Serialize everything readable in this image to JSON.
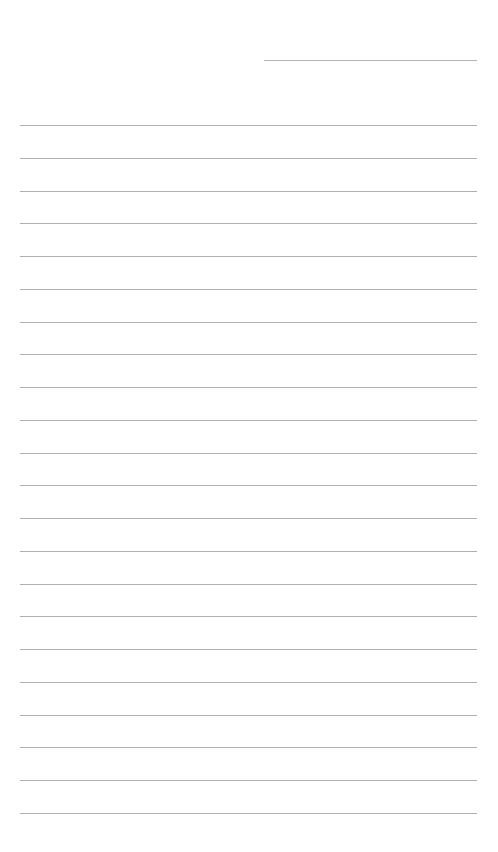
{
  "page": {
    "type": "blank-lined-paper",
    "background_color": "#ffffff",
    "line_color": "#b0b0b0",
    "header_line": {
      "present": true
    },
    "ruled_lines": {
      "count": 22,
      "first_y": 125,
      "spacing": 32.75
    },
    "text": ""
  }
}
